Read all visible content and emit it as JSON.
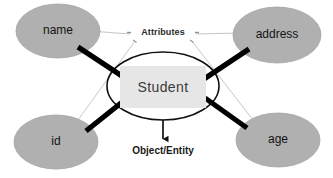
{
  "diagram": {
    "type": "entity-relationship",
    "colors": {
      "background": "#ffffff",
      "attribute_oval_fill": "#b0b0b0",
      "attribute_oval_stroke": "#9a9a9a",
      "entity_ellipse_stroke": "#111111",
      "entity_box_fill": "#e6e6e6",
      "thick_connector": "#000000",
      "thin_connector": "#b5b5b5",
      "text": "#1a1a1a"
    },
    "entity": {
      "label": "Student",
      "shape": "ellipse",
      "caption": "Object/Entity"
    },
    "attributes_label": "Attributes",
    "attributes": [
      {
        "id": "name",
        "label": "name",
        "position": "top-left"
      },
      {
        "id": "address",
        "label": "address",
        "position": "top-right"
      },
      {
        "id": "id",
        "label": "id",
        "position": "bottom-left"
      },
      {
        "id": "age",
        "label": "age",
        "position": "bottom-right"
      }
    ],
    "connectors": {
      "thick": [
        {
          "from": "name",
          "to": "Student"
        },
        {
          "from": "address",
          "to": "Student"
        },
        {
          "from": "id",
          "to": "Student"
        },
        {
          "from": "age",
          "to": "Student"
        }
      ],
      "thin_leader_lines": [
        {
          "from": "Attributes",
          "to": "name"
        },
        {
          "from": "Attributes",
          "to": "address"
        },
        {
          "from": "Attributes",
          "to": "id"
        },
        {
          "from": "Attributes",
          "to": "age"
        }
      ],
      "arrow": {
        "from": "Student",
        "to": "Object/Entity"
      }
    }
  }
}
